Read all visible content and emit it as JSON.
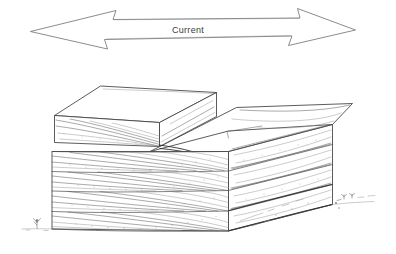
{
  "figure": {
    "background_color": "#ffffff",
    "ink_color": "#4a4a4a",
    "width": 396,
    "height": 254
  },
  "current_arrow": {
    "label": "Current",
    "type": "double-headed-arrow",
    "direction": "bidirectional",
    "label_x": 188,
    "label_y": 32,
    "left_tip_x": 30,
    "right_tip_x": 356,
    "axis_y": 30,
    "icon": "double-arrow-icon"
  },
  "block": {
    "name": "cross-bedded-sandstone-block",
    "description": "Stepped block diagram of cross-bedded strata",
    "layer_count": 4,
    "layers": [
      {
        "name": "bed-1-top",
        "style": "trough-cross-bedding"
      },
      {
        "name": "bed-2",
        "style": "trough-cross-bedding"
      },
      {
        "name": "bed-3",
        "style": "trough-cross-bedding"
      },
      {
        "name": "bed-4-base",
        "style": "trough-cross-bedding"
      }
    ],
    "upper_step": {
      "name": "raised-upper-block",
      "position": "left"
    },
    "lower_step": {
      "name": "lower-right-block",
      "position": "right"
    }
  },
  "ground": {
    "name": "ground-line",
    "vegetation_left": "grass-tuft-icon",
    "vegetation_right": "grass-tuft-icon"
  }
}
